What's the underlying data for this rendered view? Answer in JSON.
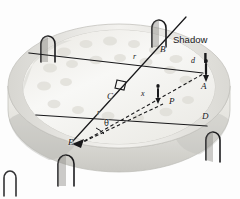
{
  "figure": {
    "type": "geometry-perspective-illustration",
    "structure": {
      "name": "circular arena",
      "description": "elliptical amphitheater bowl drawn in perspective with an outer wall containing arched niches",
      "niche_count": 5,
      "niche_shape": "arch"
    },
    "colors": {
      "line": "#1a1a1c",
      "wall_light": "#f2f1ee",
      "wall_mid": "#dcdbd6",
      "wall_shadow": "#b9b8b3",
      "floor": "#f7f7f5",
      "figure": "#1d1d1f"
    },
    "points": [
      {
        "id": "A",
        "label": "A",
        "x": 203,
        "y": 87
      },
      {
        "id": "B",
        "label": "B",
        "x": 162,
        "y": 50
      },
      {
        "id": "C",
        "label": "C",
        "x": 112,
        "y": 97
      },
      {
        "id": "D",
        "label": "D",
        "x": 204,
        "y": 117
      },
      {
        "id": "E",
        "label": "E",
        "x": 73,
        "y": 143
      },
      {
        "id": "P",
        "label": "P",
        "x": 172,
        "y": 102
      }
    ],
    "segment_labels": [
      {
        "id": "r-top",
        "label": "r",
        "x": 134,
        "y": 57
      },
      {
        "id": "r-left",
        "label": "r",
        "x": 98,
        "y": 113
      },
      {
        "id": "x",
        "label": "x",
        "x": 143,
        "y": 94
      },
      {
        "id": "d",
        "label": "d",
        "x": 193,
        "y": 62
      }
    ],
    "angle_labels": [
      {
        "id": "theta",
        "label": "θ",
        "x": 106,
        "y": 124
      }
    ],
    "annotations": [
      {
        "id": "shadow",
        "label": "Shadow",
        "x": 175,
        "y": 40
      }
    ],
    "markers": {
      "right_angle_at": "C",
      "arrow_at": "E"
    },
    "people": [
      {
        "id": "person-at-A",
        "at": "A",
        "x": 206,
        "y": 68
      },
      {
        "id": "person-at-P",
        "at": "P",
        "x": 157,
        "y": 92
      }
    ],
    "lines": [
      {
        "id": "line-E-B",
        "from": "E",
        "to": "B",
        "style": "solid"
      },
      {
        "id": "line-C-A",
        "from": "C",
        "to": "A",
        "style": "solid"
      },
      {
        "id": "line-C-D",
        "from": "C",
        "to": "D",
        "style": "solid"
      },
      {
        "id": "line-wall-C",
        "from": "wall-left",
        "to": "C",
        "style": "solid"
      },
      {
        "id": "line-E-A",
        "from": "E",
        "to": "A",
        "style": "dashed"
      },
      {
        "id": "line-E-P",
        "from": "E",
        "to": "P",
        "style": "dashed"
      }
    ]
  }
}
